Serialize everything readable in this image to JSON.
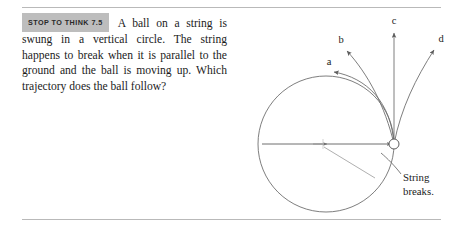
{
  "document": {
    "badge_label": "STOP TO THINK 7.5",
    "question_text": "A ball on a string is swung in a vertical circle. The string happens to break when it is parallel to the ground and the ball is moving up. Which trajectory does the ball follow?"
  },
  "figure": {
    "trajectory_labels": {
      "a": "a",
      "b": "b",
      "c": "c",
      "d": "d"
    },
    "annotation_line1": "String",
    "annotation_line2": "breaks.",
    "colors": {
      "ink": "#1b1b1b",
      "line": "#6f6f6f",
      "rule": "#b9b9b9",
      "badge_bg": "#bdbdbd"
    },
    "geometry": {
      "circle_center_x": 111,
      "circle_center_y": 138,
      "circle_radius": 68,
      "ball_x": 179,
      "ball_y": 138,
      "ball_radius": 5
    }
  }
}
